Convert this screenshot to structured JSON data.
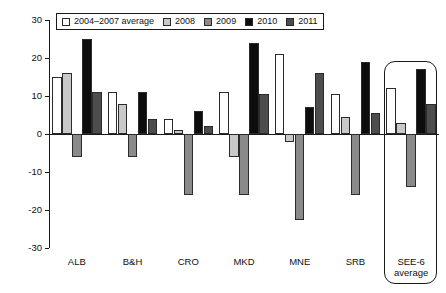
{
  "chart_data": {
    "type": "bar",
    "title": "",
    "subtitle": "",
    "xlabel": "",
    "ylabel": "",
    "ylim": [
      -30,
      30
    ],
    "yticks": [
      30,
      20,
      10,
      0,
      -10,
      -20,
      -30
    ],
    "ytick_labels": [
      "30",
      "20",
      "10",
      "0",
      "-10",
      "-20",
      "-30"
    ],
    "grid": false,
    "legend_position": "top-left-inside",
    "categories": [
      "ALB",
      "B&H",
      "CRO",
      "MKD",
      "MNE",
      "SRB",
      "SEE-6\naverage"
    ],
    "series": [
      {
        "name": "2004–2007 average",
        "color": "#ffffff",
        "values": [
          15.0,
          11.0,
          4.0,
          11.0,
          21.0,
          10.5,
          12.0
        ]
      },
      {
        "name": "2008",
        "color": "#c9c9c9",
        "values": [
          16.0,
          8.0,
          1.0,
          -6.0,
          -2.0,
          4.5,
          3.0
        ]
      },
      {
        "name": "2009",
        "color": "#8a8a8a",
        "values": [
          -6.0,
          -6.0,
          -16.0,
          -16.0,
          -22.5,
          -16.0,
          -14.0
        ]
      },
      {
        "name": "2010",
        "color": "#0d0d0d",
        "values": [
          25.0,
          11.0,
          6.0,
          24.0,
          7.0,
          19.0,
          17.0
        ]
      },
      {
        "name": "2011",
        "color": "#4d4d4d",
        "values": [
          11.0,
          4.0,
          2.0,
          10.5,
          16.0,
          5.5,
          8.0
        ]
      }
    ],
    "annotations": [
      {
        "type": "rounded-box",
        "target_category": "SEE-6\naverage",
        "label": ""
      }
    ]
  },
  "legend": {
    "items": [
      {
        "label": "2004–2007 average",
        "color": "#ffffff"
      },
      {
        "label": "2008",
        "color": "#c9c9c9"
      },
      {
        "label": "2009",
        "color": "#8a8a8a"
      },
      {
        "label": "2010",
        "color": "#0d0d0d"
      },
      {
        "label": "2011",
        "color": "#4d4d4d"
      }
    ]
  }
}
